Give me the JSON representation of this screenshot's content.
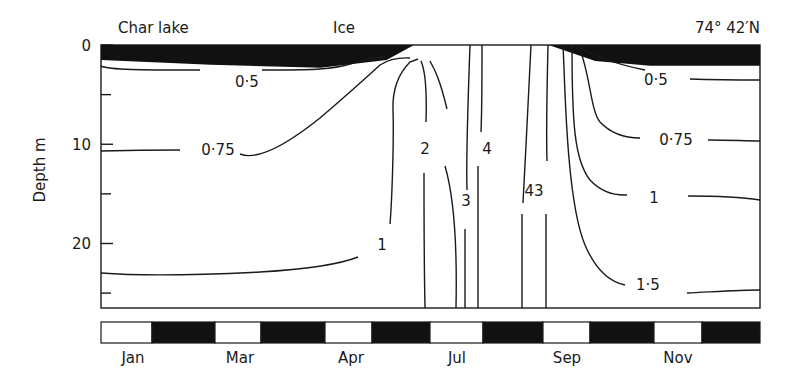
{
  "chart_data": {
    "type": "contour",
    "title": "Char lake",
    "subtitle": "74° 42′N",
    "annotation_ice": "Ice",
    "ylabel": "Depth m",
    "xlabel": "",
    "ylim": [
      0,
      26.5
    ],
    "yticks_labeled": [
      0,
      10,
      20
    ],
    "yticks_minor": [
      5,
      15,
      25
    ],
    "xlim_months": [
      0,
      12
    ],
    "month_labels": [
      "Jan",
      "Mar",
      "Apr",
      "Jul",
      "Sep",
      "Nov"
    ],
    "month_bar": {
      "segments": 12,
      "pattern": [
        "white",
        "black",
        "white",
        "black",
        "white",
        "black",
        "white",
        "black",
        "white",
        "black",
        "white",
        "black"
      ]
    },
    "ice_cover": {
      "description": "Ice layer at surface from Jan to ~mid-Jun (thickening to ~2.2 m) and again from ~Sep onward (~2 m)",
      "winter_thickness_m": [
        {
          "month": 0,
          "m": 1.5
        },
        {
          "month": 2,
          "m": 2.0
        },
        {
          "month": 4,
          "m": 2.3
        },
        {
          "month": 5.2,
          "m": 1.5
        },
        {
          "month": 5.7,
          "m": 0
        }
      ],
      "autumn_thickness_m": [
        {
          "month": 8.15,
          "m": 0
        },
        {
          "month": 9,
          "m": 1.6
        },
        {
          "month": 10,
          "m": 2.1
        },
        {
          "month": 12,
          "m": 2.1
        }
      ]
    },
    "isotherms": [
      {
        "label": "0·5",
        "value": 0.5
      },
      {
        "label": "0·75",
        "value": 0.75
      },
      {
        "label": "1",
        "value": 1
      },
      {
        "label": "2",
        "value": 2
      },
      {
        "label": "3",
        "value": 3
      },
      {
        "label": "4",
        "value": 4
      },
      {
        "label": "43",
        "value": "4/3"
      },
      {
        "label": "0·5",
        "value": 0.5
      },
      {
        "label": "0·75",
        "value": 0.75
      },
      {
        "label": "1",
        "value": 1
      },
      {
        "label": "1·5",
        "value": 1.5
      }
    ],
    "grid": false,
    "legend": "none"
  }
}
